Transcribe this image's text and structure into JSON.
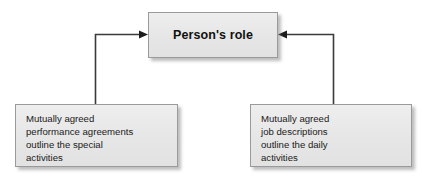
{
  "diagram": {
    "type": "flow-diagram",
    "title_node": {
      "label": "Person's role"
    },
    "left_node": {
      "line1": "Mutually agreed",
      "line2": "performance agreements",
      "line3": "outline the special",
      "line4": "activities"
    },
    "right_node": {
      "line1": "Mutually agreed",
      "line2": "job descriptions",
      "line3": "outline the daily",
      "line4": "activities"
    },
    "connectors": [
      {
        "name": "left-to-role",
        "from": "left_node",
        "to": "title_node",
        "arrow_direction": "right"
      },
      {
        "name": "right-to-role",
        "from": "right_node",
        "to": "title_node",
        "arrow_direction": "left"
      }
    ],
    "colors": {
      "box_fill": "#e9e9e9",
      "box_border": "#9a9a9a",
      "connector": "#3a3a3a",
      "text": "#1a1a1a",
      "background": "#ffffff"
    }
  }
}
